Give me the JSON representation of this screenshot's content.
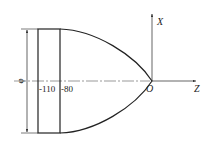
{
  "diagram": {
    "axes": {
      "x_label": "X",
      "z_label": "Z",
      "origin_label": "O"
    },
    "dimensions": {
      "diameter_symbol": "φ",
      "z_marks": [
        "-110",
        "-80"
      ]
    },
    "colors": {
      "line": "#222222",
      "background": "#ffffff"
    }
  }
}
